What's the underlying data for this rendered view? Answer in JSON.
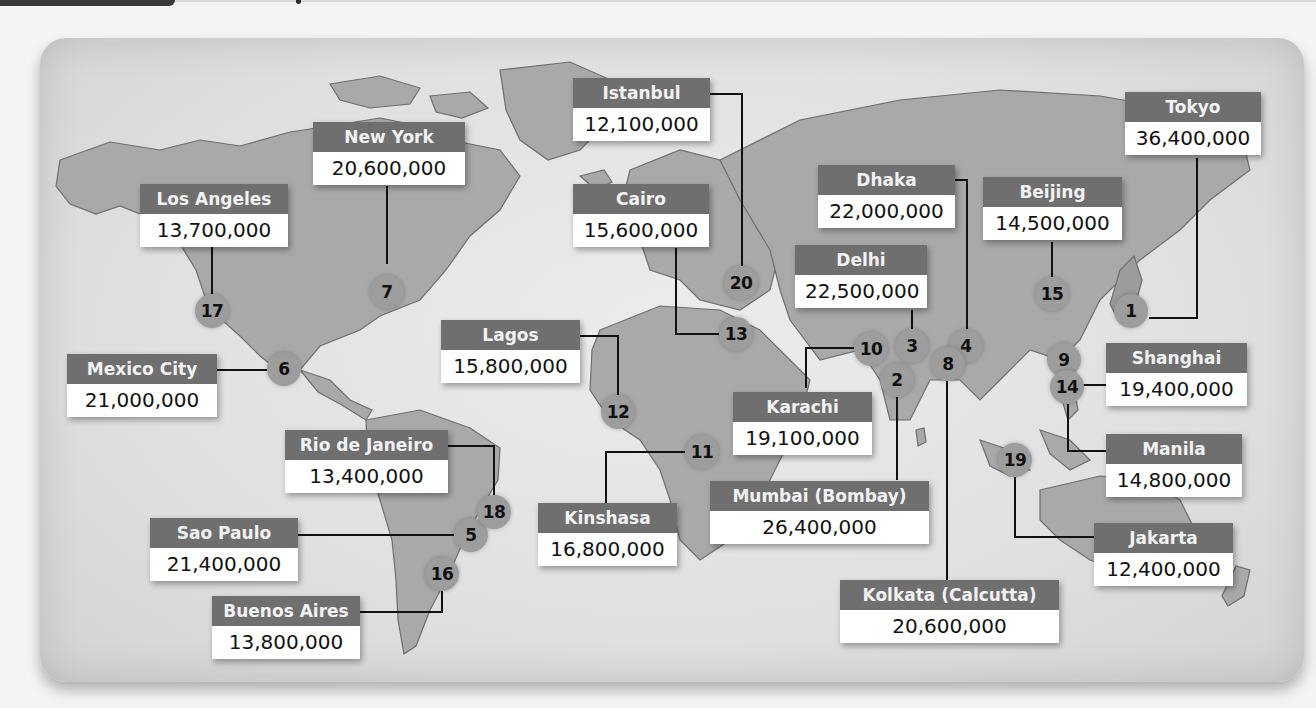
{
  "map": {
    "type": "world-map",
    "subject": "Largest urban areas by population",
    "colors": {
      "label_header": "#6f6f6f",
      "label_body": "#ffffff",
      "marker": "#9d9d9d",
      "land": "#a9a9a9",
      "ocean": "#e4e4e4",
      "leader_line": "#111111"
    },
    "cities": [
      {
        "rank": "1",
        "name": "Tokyo",
        "population": "36,400,000"
      },
      {
        "rank": "2",
        "name": "Mumbai (Bombay)",
        "population": "26,400,000"
      },
      {
        "rank": "3",
        "name": "Delhi",
        "population": "22,500,000"
      },
      {
        "rank": "4",
        "name": "Dhaka",
        "population": "22,000,000"
      },
      {
        "rank": "5",
        "name": "Sao Paulo",
        "population": "21,400,000"
      },
      {
        "rank": "6",
        "name": "Mexico City",
        "population": "21,000,000"
      },
      {
        "rank": "7",
        "name": "New York",
        "population": "20,600,000"
      },
      {
        "rank": "8",
        "name": "Kolkata (Calcutta)",
        "population": "20,600,000"
      },
      {
        "rank": "9",
        "name": "Shanghai",
        "population": "19,400,000"
      },
      {
        "rank": "10",
        "name": "Karachi",
        "population": "19,100,000"
      },
      {
        "rank": "11",
        "name": "Kinshasa",
        "population": "16,800,000"
      },
      {
        "rank": "12",
        "name": "Lagos",
        "population": "15,800,000"
      },
      {
        "rank": "13",
        "name": "Cairo",
        "population": "15,600,000"
      },
      {
        "rank": "14",
        "name": "Manila",
        "population": "14,800,000"
      },
      {
        "rank": "15",
        "name": "Beijing",
        "population": "14,500,000"
      },
      {
        "rank": "16",
        "name": "Buenos Aires",
        "population": "13,800,000"
      },
      {
        "rank": "17",
        "name": "Los Angeles",
        "population": "13,700,000"
      },
      {
        "rank": "18",
        "name": "Rio de Janeiro",
        "population": "13,400,000"
      },
      {
        "rank": "19",
        "name": "Jakarta",
        "population": "12,400,000"
      },
      {
        "rank": "20",
        "name": "Istanbul",
        "population": "12,100,000"
      }
    ]
  }
}
